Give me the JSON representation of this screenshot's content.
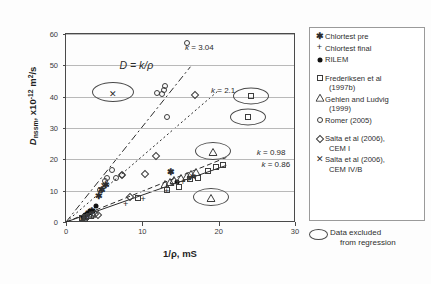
{
  "chart_data": {
    "type": "scatter",
    "title": "",
    "xlabel": "1/ρ, mS",
    "ylabel": "Dnssm, x10-12 m2/s",
    "xlim": [
      0,
      30
    ],
    "ylim": [
      0,
      60
    ],
    "xticks": [
      0,
      10,
      20,
      30
    ],
    "yticks": [
      0,
      10,
      20,
      30,
      40,
      50,
      60
    ],
    "grid": "horizontal",
    "legend_position": "right",
    "annotations": [
      {
        "text": "D = k/ρ",
        "x": 7.0,
        "y": 52.0
      },
      {
        "text": "k = 3.04",
        "x": 15.6,
        "y": 57.0
      },
      {
        "text": "k = 2.1",
        "x": 19.0,
        "y": 43.5
      },
      {
        "text": "k = 0.98",
        "x": 25.0,
        "y": 23.5
      },
      {
        "text": "k = 0.86",
        "x": 25.6,
        "y": 19.8
      }
    ],
    "trendlines": [
      {
        "name": "k = 3.04",
        "slope": 3.04,
        "style": "dash-dot",
        "x_from": 0,
        "x_to": 16.3
      },
      {
        "name": "k = 2.1",
        "slope": 2.1,
        "style": "dotted",
        "x_from": 0,
        "x_to": 20.0
      },
      {
        "name": "k = 0.98",
        "slope": 0.98,
        "style": "dashed",
        "x_from": 0,
        "x_to": 21.0
      },
      {
        "name": "k = 0.86",
        "slope": 0.86,
        "style": "solid",
        "x_from": 0,
        "x_to": 21.0
      }
    ],
    "series": [
      {
        "name": "Chlortest pre",
        "marker": "asterisk",
        "points": [
          [
            2.4,
            2.0
          ],
          [
            3.0,
            3.4
          ],
          [
            3.4,
            4.2
          ],
          [
            4.3,
            9.0
          ],
          [
            4.7,
            11.0
          ],
          [
            5.2,
            12.4
          ],
          [
            13.8,
            16.5
          ]
        ]
      },
      {
        "name": "Chlortest final",
        "marker": "plus",
        "points": [
          [
            2.2,
            1.6
          ],
          [
            2.8,
            2.6
          ],
          [
            3.3,
            3.4
          ],
          [
            7.8,
            6.3
          ],
          [
            10.1,
            8.1
          ],
          [
            13.2,
            10.6
          ],
          [
            15.3,
            13.4
          ],
          [
            16.1,
            14.0
          ]
        ]
      },
      {
        "name": "RILEM",
        "marker": "filled-circle",
        "points": [
          [
            2.2,
            1.5
          ],
          [
            2.5,
            2.2
          ],
          [
            2.8,
            2.6
          ],
          [
            3.0,
            3.0
          ],
          [
            3.2,
            3.4
          ],
          [
            3.5,
            3.6
          ],
          [
            3.9,
            5.2
          ],
          [
            14.6,
            12.7
          ]
        ]
      },
      {
        "name": "Frederiksen et al (1997b)",
        "marker": "square",
        "points": [
          [
            2.1,
            1.2
          ],
          [
            2.6,
            1.6
          ],
          [
            3.0,
            2.0
          ],
          [
            9.4,
            7.7
          ],
          [
            13.2,
            10.2
          ],
          [
            14.8,
            11.2
          ],
          [
            16.2,
            13.8
          ],
          [
            17.3,
            14.0
          ],
          [
            18.6,
            16.2
          ],
          [
            19.6,
            17.5
          ],
          [
            20.6,
            18.3
          ],
          [
            24.2,
            40.2
          ],
          [
            23.9,
            33.4
          ]
        ]
      },
      {
        "name": "Gehlen and Ludvig (1999)",
        "marker": "triangle",
        "points": [
          [
            2.3,
            1.6
          ],
          [
            3.1,
            2.4
          ],
          [
            13.0,
            12.4
          ],
          [
            13.6,
            13.0
          ],
          [
            14.2,
            13.6
          ],
          [
            15.1,
            14.4
          ],
          [
            15.8,
            15.0
          ],
          [
            16.4,
            15.6
          ],
          [
            17.0,
            16.2
          ],
          [
            19.2,
            22.8
          ],
          [
            19.0,
            8.0
          ]
        ]
      },
      {
        "name": "Romer (2005)",
        "marker": "open-circle",
        "points": [
          [
            4.5,
            10.2
          ],
          [
            5.1,
            13.0
          ],
          [
            5.4,
            14.0
          ],
          [
            6.0,
            16.6
          ],
          [
            6.6,
            14.0
          ],
          [
            7.4,
            15.0
          ],
          [
            11.9,
            41.2
          ],
          [
            12.6,
            41.0
          ],
          [
            13.0,
            43.5
          ],
          [
            12.9,
            42.0
          ],
          [
            13.2,
            33.4
          ],
          [
            15.9,
            57.0
          ]
        ]
      },
      {
        "name": "Salta et al (2006), CEM I",
        "marker": "diamond",
        "points": [
          [
            2.6,
            1.4
          ],
          [
            3.4,
            2.2
          ],
          [
            3.8,
            2.6
          ],
          [
            4.2,
            2.2
          ],
          [
            7.4,
            15.0
          ],
          [
            8.4,
            8.1
          ],
          [
            10.3,
            15.2
          ],
          [
            11.8,
            21.2
          ],
          [
            16.9,
            40.6
          ]
        ]
      },
      {
        "name": "Salta et al (2006), CEM IV/B",
        "marker": "x-cross",
        "points": [
          [
            4.6,
            10.8
          ],
          [
            5.0,
            12.0
          ],
          [
            6.1,
            41.4
          ],
          [
            13.8,
            16.5
          ],
          [
            16.6,
            15.0
          ]
        ]
      }
    ],
    "excluded_markers": [
      {
        "x": 6.1,
        "y": 41.4,
        "rw": 40,
        "rh": 18
      },
      {
        "x": 19.2,
        "y": 22.8,
        "rw": 34,
        "rh": 16
      },
      {
        "x": 24.2,
        "y": 40.2,
        "rw": 34,
        "rh": 15
      },
      {
        "x": 23.9,
        "y": 33.4,
        "rw": 34,
        "rh": 15
      },
      {
        "x": 19.0,
        "y": 8.0,
        "rw": 34,
        "rh": 16
      }
    ]
  },
  "axes": {
    "y_label_main": "D",
    "y_label_sub": "nssm",
    "y_label_rest": ", x10",
    "y_label_exp": "-12",
    "y_label_units": " m",
    "y_label_units_exp": "2",
    "y_label_units_tail": "/s",
    "x_label": "1/ρ, mS",
    "yticks": [
      "0",
      "10",
      "20",
      "30",
      "40",
      "50",
      "60"
    ],
    "xticks": [
      "0",
      "10",
      "20",
      "30"
    ]
  },
  "formula": {
    "lhs": "D",
    "rhs": " = k/ρ"
  },
  "klabels": {
    "k304": "k = 3.04",
    "k21": "k = 2.1",
    "k098": "k = 0.98",
    "k086": "k = 0.86"
  },
  "legend": {
    "items": [
      {
        "marker": "asterisk",
        "label": "Chlortest pre",
        "label2": ""
      },
      {
        "marker": "plus",
        "label": "Chlortest final",
        "label2": ""
      },
      {
        "marker": "filled-circle",
        "label": "RILEM",
        "label2": ""
      },
      {
        "marker": "square",
        "label": "Frederiksen et al",
        "label2": "(1997b)"
      },
      {
        "marker": "triangle",
        "label": "Gehlen and Ludvig",
        "label2": "(1999)"
      },
      {
        "marker": "open-circle",
        "label": "Romer (2005)",
        "label2": ""
      },
      {
        "marker": "diamond",
        "label": "Salta et al (2006),",
        "label2": "CEM I"
      },
      {
        "marker": "x-cross",
        "label": "Salta et al (2006),",
        "label2": "CEM IV/B"
      }
    ]
  },
  "excluded_note": {
    "line1": "Data excluded",
    "line2": "from regression"
  }
}
